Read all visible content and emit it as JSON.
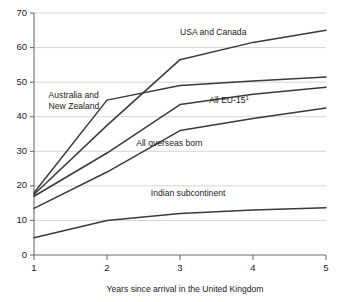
{
  "chart_data": {
    "type": "line",
    "title": "",
    "xlabel": "Years since arrival in the United Kingdom",
    "ylabel": "",
    "xlim": [
      1,
      5
    ],
    "ylim": [
      0,
      70
    ],
    "xticks": [
      1,
      2,
      3,
      4,
      5
    ],
    "yticks": [
      0,
      10,
      20,
      30,
      40,
      50,
      60,
      70
    ],
    "grid": true,
    "legend_position": "inline-annotations",
    "x": [
      1,
      2,
      3,
      4,
      5
    ],
    "series": [
      {
        "name": "USA and Canada",
        "values": [
          17.5,
          37.5,
          56.5,
          61.5,
          65.0
        ],
        "label_x": 3.0,
        "label_y": 63.5
      },
      {
        "name": "Australia and New Zealand",
        "values": [
          18.0,
          44.8,
          49.0,
          50.3,
          51.5
        ],
        "label_x": 1.2,
        "label_y": 45.5
      },
      {
        "name": "All EU-15",
        "superscript": "1",
        "values": [
          17.0,
          29.5,
          43.5,
          46.5,
          48.5
        ],
        "label_x": 3.4,
        "label_y": 44.0
      },
      {
        "name": "All overseas born",
        "values": [
          13.5,
          24.0,
          36.0,
          39.5,
          42.5
        ],
        "label_x": 2.4,
        "label_y": 31.5
      },
      {
        "name": "Indian subcontinent",
        "values": [
          5.0,
          10.0,
          12.0,
          13.0,
          13.7
        ],
        "label_x": 2.6,
        "label_y": 17.0
      }
    ],
    "xtick_labels": [
      "1",
      "2",
      "3",
      "4",
      "5"
    ],
    "ytick_labels": [
      "0",
      "10",
      "20",
      "30",
      "40",
      "50",
      "60",
      "70"
    ],
    "colors": {
      "line": "#3a3a3a",
      "grid": "#c9c9c9",
      "axis": "#6e6e6e",
      "text": "#1a1a1a",
      "background": "#ffffff"
    }
  }
}
